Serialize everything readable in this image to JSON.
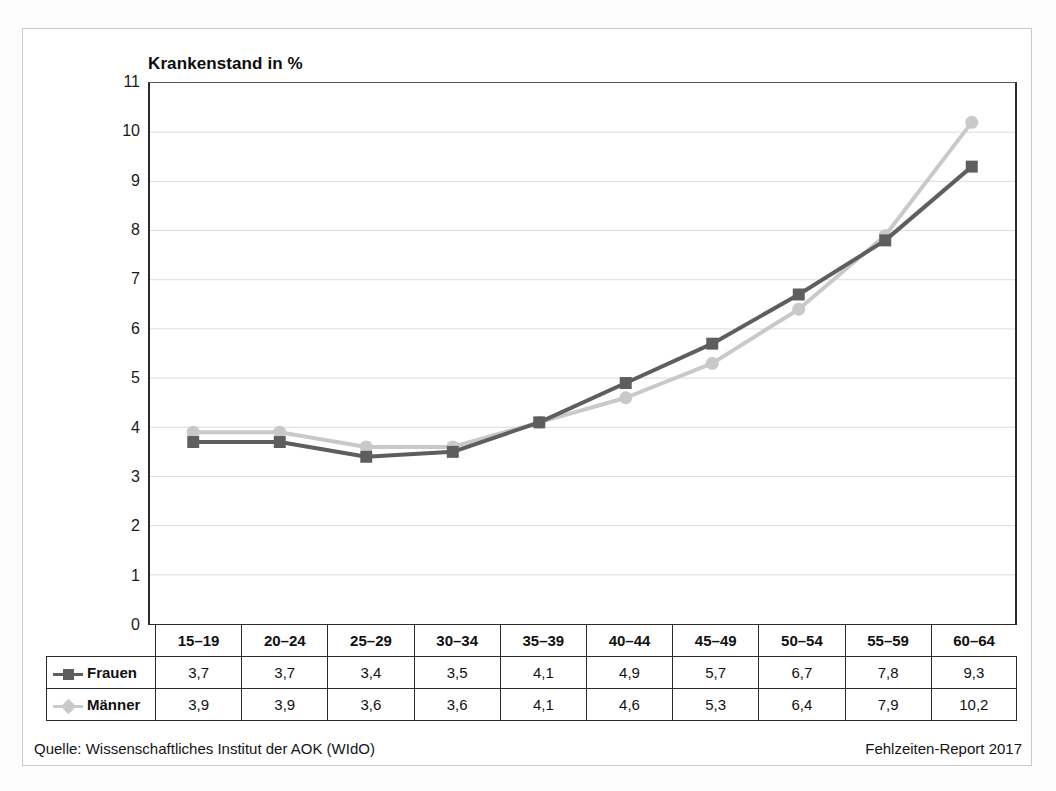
{
  "chart_data": {
    "type": "line",
    "title": "Krankenstand in %",
    "xlabel": "",
    "ylabel": "Krankenstand in %",
    "categories": [
      "15–19",
      "20–24",
      "25–29",
      "30–34",
      "35–39",
      "40–44",
      "45–49",
      "50–54",
      "55–59",
      "60–64"
    ],
    "series": [
      {
        "name": "Frauen",
        "values": [
          3.7,
          3.7,
          3.4,
          3.5,
          4.1,
          4.9,
          5.7,
          6.7,
          7.8,
          9.3
        ],
        "labels": [
          "3,7",
          "3,7",
          "3,4",
          "3,5",
          "4,1",
          "4,9",
          "5,7",
          "6,7",
          "7,8",
          "9,3"
        ],
        "color": "#5e5e5e",
        "marker": "square"
      },
      {
        "name": "Männer",
        "values": [
          3.9,
          3.9,
          3.6,
          3.6,
          4.1,
          4.6,
          5.3,
          6.4,
          7.9,
          10.2
        ],
        "labels": [
          "3,9",
          "3,9",
          "3,6",
          "3,6",
          "4,1",
          "4,6",
          "5,3",
          "6,4",
          "7,9",
          "10,2"
        ],
        "color": "#c9c9c9",
        "marker": "circle"
      }
    ],
    "ylim": [
      0,
      11
    ],
    "yticks": [
      0,
      1,
      2,
      3,
      4,
      5,
      6,
      7,
      8,
      9,
      10,
      11
    ],
    "ytick_labels": [
      "0",
      "1",
      "2",
      "3",
      "4",
      "5",
      "6",
      "7",
      "8",
      "9",
      "10",
      "11"
    ],
    "grid": "horizontal",
    "legend_position": "table-row-labels"
  },
  "footer": {
    "source": "Quelle: Wissenschaftliches Institut der AOK (WIdO)",
    "report": "Fehlzeiten-Report 2017"
  }
}
